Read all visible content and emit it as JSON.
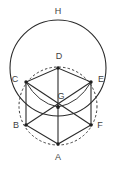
{
  "figure": {
    "canvas": {
      "width": 115,
      "height": 171,
      "background": "#ffffff"
    },
    "colors": {
      "stroke": "#2b2b2b",
      "stroke_light": "#3a3a3a",
      "label": "#3f3f3f",
      "vertex": "#1f1f1f"
    },
    "labels": {
      "A": "A",
      "B": "B",
      "C": "C",
      "D": "D",
      "E": "E",
      "F": "F",
      "G": "G",
      "H": "H"
    },
    "label_positions": {
      "A": {
        "x": 58,
        "y": 158
      },
      "B": {
        "x": 16,
        "y": 126
      },
      "C": {
        "x": 15,
        "y": 80
      },
      "D": {
        "x": 59,
        "y": 57
      },
      "E": {
        "x": 101,
        "y": 80
      },
      "F": {
        "x": 100,
        "y": 126
      },
      "G": {
        "x": 61,
        "y": 97
      },
      "H": {
        "x": 58,
        "y": 12
      }
    },
    "points": {
      "A": {
        "x": 58,
        "y": 144
      },
      "B": {
        "x": 26,
        "y": 125
      },
      "C": {
        "x": 26,
        "y": 82
      },
      "D": {
        "x": 58,
        "y": 68
      },
      "E": {
        "x": 91,
        "y": 82
      },
      "F": {
        "x": 91,
        "y": 125
      },
      "G": {
        "x": 58,
        "y": 107
      }
    },
    "hexagon_path": "M 58 144 L 26 125 L 26 82 L 58 68 L 91 82 L 91 125 Z",
    "diagonals": [
      {
        "name": "A-D",
        "d": "M 58 144 L 58 68"
      },
      {
        "name": "B-E",
        "d": "M 26 125 L 91 82"
      },
      {
        "name": "C-F",
        "d": "M 26 82 L 91 125"
      }
    ],
    "arcs": [
      {
        "name": "arc-C-to-G",
        "d": "M 26 82 Q 38 103 58 107"
      },
      {
        "name": "arc-E-to-G",
        "d": "M 91 82 Q 79 103 58 107"
      }
    ],
    "circles": {
      "circumcircle_dashed": {
        "cx": 58,
        "cy": 106,
        "r": 39,
        "style": "dashed"
      },
      "outer_circle_solid": {
        "cx": 58,
        "cy": 68,
        "r": 48,
        "style": "solid"
      }
    }
  }
}
